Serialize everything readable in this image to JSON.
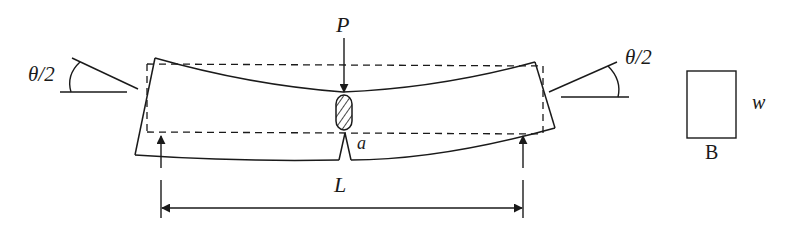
{
  "diagram": {
    "labels": {
      "load": "P",
      "crack_depth": "a",
      "span": "L",
      "left_rotation": "θ/2",
      "right_rotation": "θ/2",
      "width": "w",
      "thickness": "B"
    },
    "colors": {
      "stroke": "#1a1a1a",
      "background": "#ffffff"
    },
    "elements": [
      "deformed-beam-outline",
      "undeformed-beam-dashed-outline",
      "load-arrow-P",
      "hatched-indenter",
      "crack-notch",
      "left-support-arrow",
      "right-support-arrow",
      "span-dimension-L",
      "left-rotation-angle",
      "right-rotation-angle",
      "cross-section-rectangle"
    ]
  }
}
